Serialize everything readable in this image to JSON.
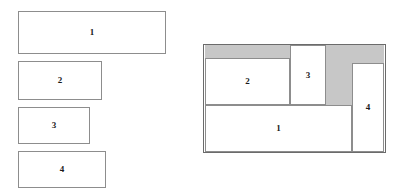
{
  "figure": {
    "kind": "rectangle-packing-diagram",
    "canvas": {
      "width": 413,
      "height": 194,
      "background": "#ffffff"
    },
    "colors": {
      "piece_fill": "#ffffff",
      "piece_stroke": "#8d8d8d",
      "bin_stroke": "#6b6b6b",
      "waste_fill": "#c7c7c7",
      "label_color": "#1a1a1a"
    }
  },
  "input_pieces": {
    "caption": "",
    "items": [
      {
        "label": "1",
        "x": 18,
        "y": 11,
        "w": 148,
        "h": 43
      },
      {
        "label": "2",
        "x": 18,
        "y": 61,
        "w": 84,
        "h": 39
      },
      {
        "label": "3",
        "x": 18,
        "y": 107,
        "w": 72,
        "h": 37
      },
      {
        "label": "4",
        "x": 18,
        "y": 151,
        "w": 88,
        "h": 37
      }
    ]
  },
  "packing": {
    "bin": {
      "x": 203,
      "y": 44,
      "w": 183,
      "h": 109
    },
    "waste_regions": [
      {
        "name": "waste-top-left",
        "x": 205,
        "y": 45,
        "w": 85,
        "h": 13
      },
      {
        "name": "waste-top-right",
        "x": 326,
        "y": 45,
        "w": 58,
        "h": 18
      },
      {
        "name": "waste-right-col",
        "x": 326,
        "y": 63,
        "w": 26,
        "h": 42
      }
    ],
    "placed": [
      {
        "label": "1",
        "x": 205,
        "y": 105,
        "w": 147,
        "h": 47
      },
      {
        "label": "2",
        "x": 205,
        "y": 58,
        "w": 85,
        "h": 47
      },
      {
        "label": "3",
        "x": 290,
        "y": 45,
        "w": 36,
        "h": 60
      },
      {
        "label": "4",
        "x": 352,
        "y": 63,
        "w": 32,
        "h": 89
      }
    ]
  }
}
